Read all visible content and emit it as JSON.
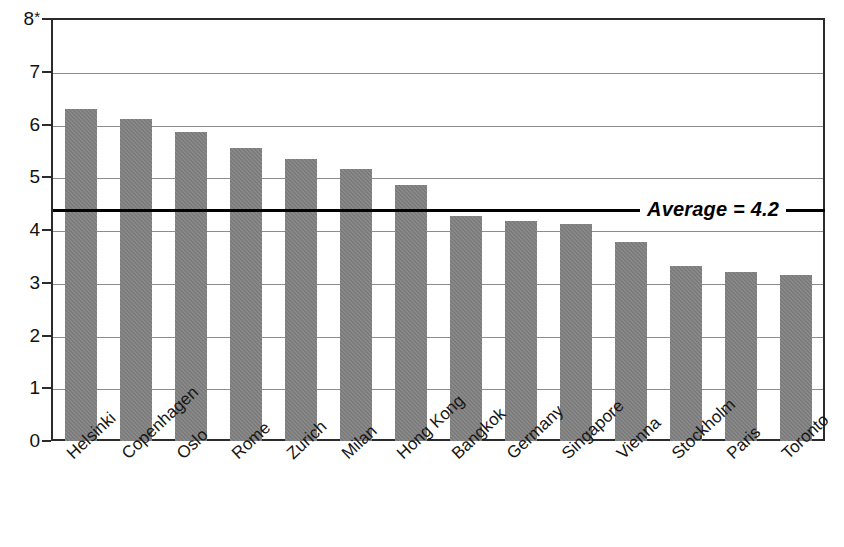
{
  "chart_data": {
    "type": "bar",
    "title": "",
    "subtitle": "",
    "xlabel": "",
    "ylabel": "",
    "ylim": [
      0,
      8
    ],
    "ytick_labels": [
      "8*",
      "7",
      "6",
      "5",
      "4",
      "3",
      "2",
      "1",
      "0"
    ],
    "yticks": [
      8,
      7,
      6,
      5,
      4,
      3,
      2,
      1,
      0
    ],
    "grid": "horizontal",
    "legend": "none",
    "top_tick_note": "8*",
    "categories": [
      "Helsinki",
      "Copenhagen",
      "Oslo",
      "Rome",
      "Zurich",
      "Milan",
      "Hong Kong",
      "Bangkok",
      "Germany",
      "Singapore",
      "Vienna",
      "Stockholm",
      "Paris",
      "Toronto"
    ],
    "values": [
      6.3,
      6.1,
      5.85,
      5.55,
      5.35,
      5.15,
      4.85,
      4.27,
      4.18,
      4.12,
      3.78,
      3.32,
      3.2,
      3.15
    ],
    "annotations": [
      {
        "name": "average-line",
        "label": "Average = 4.2",
        "value": 4.37,
        "display_value": "4.2",
        "style": "solid-black-line"
      }
    ],
    "bar_color": "#7b7b7b",
    "axis_color": "#2b2b2b",
    "grid_color": "#8d8d8d",
    "average_line_color": "#000000"
  }
}
